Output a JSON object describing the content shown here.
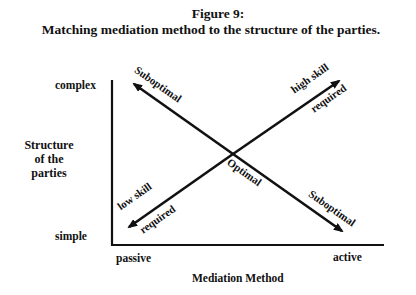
{
  "figure": {
    "number_label": "Figure 9:",
    "title": "Matching mediation method to the structure of the parties."
  },
  "axes": {
    "y_label_lines": [
      "Structure",
      "of the",
      "parties"
    ],
    "y_top_tick": "complex",
    "y_bottom_tick": "simple",
    "x_label": "Mediation Method",
    "x_left_tick": "passive",
    "x_right_tick": "active"
  },
  "arrows": {
    "top_left": {
      "label": "Suboptimal"
    },
    "top_right": {
      "label_line1": "high skill",
      "label_line2": "required"
    },
    "bottom_left": {
      "label_line1": "low skill",
      "label_line2": "required"
    },
    "bottom_right": {
      "label": "Suboptimal"
    }
  },
  "center_label": "Optimal",
  "colors": {
    "ink": "#111111",
    "background": "#ffffff"
  }
}
